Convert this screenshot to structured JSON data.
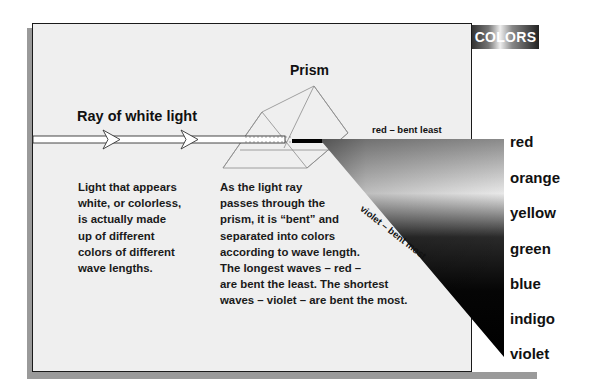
{
  "diagram": {
    "title_prism": "Prism",
    "title_ray": "Ray of white light",
    "label_red_bent": "red – bent least",
    "label_violet_bent": "violet – bent most",
    "text_left": [
      "Light that appears",
      "white, or colorless,",
      "is actually made",
      "up of different",
      "colors of different",
      "wave lengths."
    ],
    "text_middle": [
      "As the light ray",
      "passes through the",
      "prism, it is “bent” and",
      "separated into colors",
      "according to wave length.",
      "The longest waves – red –",
      "are bent the least. The shortest",
      "waves – violet – are bent the most."
    ]
  },
  "colors_panel": {
    "header": "COLORS",
    "items": [
      "red",
      "orange",
      "yellow",
      "green",
      "blue",
      "indigo",
      "violet"
    ]
  }
}
